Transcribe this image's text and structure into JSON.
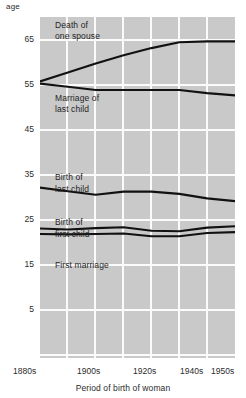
{
  "chart_data": {
    "type": "line",
    "title": "",
    "xlabel": "Period of birth of woman",
    "ylabel": "age",
    "ylim": [
      0,
      70
    ],
    "yticks": [
      65,
      55,
      45,
      35,
      25,
      15,
      5
    ],
    "categories": [
      "1880s",
      "1890s",
      "1900s",
      "1910s",
      "1920s",
      "1930s",
      "1940s",
      "1950s"
    ],
    "xticklabels": [
      "1880s",
      "1900s",
      "1920s",
      "1940s",
      "1950s"
    ],
    "grid": true,
    "legend": "inline-annotations",
    "series": [
      {
        "name": "Death of one spouse",
        "label": "Death of\none spouse",
        "x": [
          "1880s",
          "1890s",
          "1900s",
          "1910s",
          "1920s",
          "1930s",
          "1940s",
          "1950s"
        ],
        "values": [
          55.8,
          57.8,
          59.8,
          61.6,
          63.2,
          64.5,
          64.7,
          64.7
        ]
      },
      {
        "name": "Marriage of last child",
        "label": "Marriage of\nlast child",
        "x": [
          "1880s",
          "1890s",
          "1900s",
          "1910s",
          "1920s",
          "1930s",
          "1940s",
          "1950s"
        ],
        "values": [
          55.3,
          54.6,
          53.9,
          53.9,
          53.9,
          53.9,
          53.2,
          52.7
        ]
      },
      {
        "name": "Birth of last child",
        "label": "Birth of\nlast child",
        "x": [
          "1880s",
          "1890s",
          "1900s",
          "1910s",
          "1920s",
          "1930s",
          "1940s",
          "1950s"
        ],
        "values": [
          32.2,
          31.4,
          30.6,
          31.3,
          31.3,
          30.8,
          29.8,
          29.2
        ]
      },
      {
        "name": "Birth of first child",
        "label": "Birth of\nfirst child",
        "x": [
          "1880s",
          "1890s",
          "1900s",
          "1910s",
          "1920s",
          "1930s",
          "1940s",
          "1950s"
        ],
        "values": [
          23.1,
          22.9,
          23.2,
          23.4,
          22.6,
          22.5,
          23.3,
          23.6
        ]
      },
      {
        "name": "First marriage",
        "label": "First marriage",
        "x": [
          "1880s",
          "1890s",
          "1900s",
          "1910s",
          "1920s",
          "1930s",
          "1940s",
          "1950s"
        ],
        "values": [
          21.9,
          21.8,
          21.9,
          22.0,
          21.4,
          21.4,
          22.1,
          22.3
        ]
      }
    ]
  },
  "axes": {
    "y_axis_name": "age",
    "x_axis_name": "Period of birth of woman",
    "yticks": [
      {
        "label": "65",
        "value": 65
      },
      {
        "label": "55",
        "value": 55
      },
      {
        "label": "45",
        "value": 45
      },
      {
        "label": "35",
        "value": 35
      },
      {
        "label": "25",
        "value": 25
      },
      {
        "label": "15",
        "value": 15
      },
      {
        "label": "5",
        "value": 5
      }
    ],
    "xticks": [
      {
        "label": "1880s"
      },
      {
        "label": "1900s"
      },
      {
        "label": "1920s"
      },
      {
        "label": "1940s"
      },
      {
        "label": "1950s"
      }
    ]
  },
  "annotations": {
    "death_of_one_spouse_line1": "Death of",
    "death_of_one_spouse_line2": "one spouse",
    "marriage_of_last_child_line1": "Marriage of",
    "marriage_of_last_child_line2": "last child",
    "birth_of_last_child_line1": "Birth of",
    "birth_of_last_child_line2": "last child",
    "birth_of_first_child_line1": "Birth of",
    "birth_of_first_child_line2": "first child",
    "first_marriage": "First marriage"
  },
  "colors": {
    "plot_background": "#c9c9c9",
    "gridline": "#fbfbfb",
    "line": "#111111",
    "text": "#1f1f1f",
    "page_background": "#ffffff"
  }
}
